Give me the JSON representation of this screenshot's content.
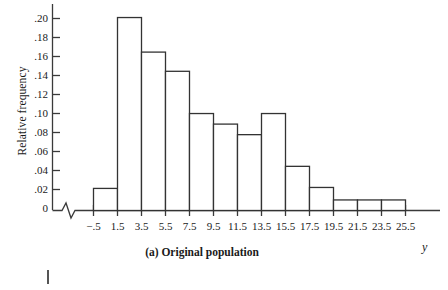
{
  "chart_data": {
    "type": "bar",
    "title": "",
    "caption": "(a) Original population",
    "xlabel": "y",
    "ylabel": "Relative frequency",
    "x_tick_labels": [
      "−.5",
      "1.5",
      "3.5",
      "5.5",
      "7.5",
      "9.5",
      "11.5",
      "13.5",
      "15.5",
      "17.5",
      "19.5",
      "21.5",
      "23.5",
      "25.5"
    ],
    "y_tick_labels": [
      ".20",
      ".18",
      ".16",
      ".14",
      ".12",
      ".10",
      ".08",
      ".06",
      ".04",
      ".02",
      "0"
    ],
    "y_tick_values": [
      0.2,
      0.18,
      0.16,
      0.14,
      0.12,
      0.1,
      0.08,
      0.06,
      0.04,
      0.02,
      0
    ],
    "ylim": [
      0,
      0.205
    ],
    "xlim": [
      -0.5,
      25.5
    ],
    "bin_width": 2,
    "bin_edges": [
      -0.5,
      1.5,
      3.5,
      5.5,
      7.5,
      9.5,
      11.5,
      13.5,
      15.5,
      17.5,
      19.5,
      21.5,
      23.5,
      25.5
    ],
    "categories": [
      "-.5 to 1.5",
      "1.5 to 3.5",
      "3.5 to 5.5",
      "5.5 to 7.5",
      "7.5 to 9.5",
      "9.5 to 11.5",
      "11.5 to 13.5",
      "13.5 to 15.5",
      "15.5 to 17.5",
      "17.5 to 19.5",
      "19.5 to 21.5",
      "21.5 to 23.5",
      "23.5 to 25.5"
    ],
    "values": [
      0.023,
      0.201,
      0.165,
      0.145,
      0.101,
      0.09,
      0.079,
      0.101,
      0.046,
      0.024,
      0.011,
      0.011,
      0.011
    ],
    "grid": false,
    "legend": null,
    "axis_break": true,
    "bar_style": "outline",
    "bar_color": "#ffffff",
    "bar_edge_color": "#333333"
  },
  "axis": {
    "y_title": "Relative frequency",
    "x_title": "y"
  },
  "figure": {
    "caption": "(a) Original population"
  }
}
